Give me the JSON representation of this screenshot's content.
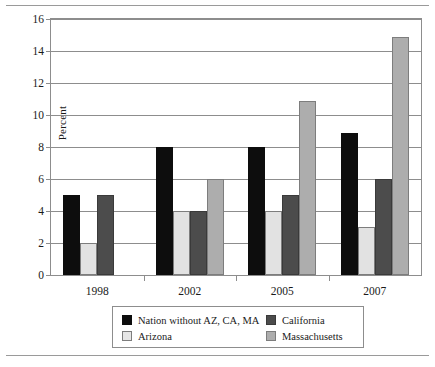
{
  "chart_data": {
    "type": "bar",
    "title": "",
    "xlabel": "",
    "ylabel": "Percent",
    "categories": [
      "1998",
      "2002",
      "2005",
      "2007"
    ],
    "ylim": [
      0,
      16
    ],
    "yticks": [
      0,
      2,
      4,
      6,
      8,
      10,
      12,
      14,
      16
    ],
    "ytick_labels": [
      "0",
      "2",
      "4",
      "6",
      "8",
      "10",
      "12",
      "14",
      "16"
    ],
    "grid": true,
    "legend_position": "bottom",
    "series": [
      {
        "name": "Nation without AZ, CA, MA",
        "color": "#0d0d0d",
        "values": [
          5,
          8,
          8,
          8.9
        ]
      },
      {
        "name": "Arizona",
        "color": "#e2e2e2",
        "values": [
          2,
          4,
          4,
          3
        ]
      },
      {
        "name": "California",
        "color": "#4c4c4c",
        "values": [
          5,
          4,
          5,
          6
        ]
      },
      {
        "name": "Massachusetts",
        "color": "#adadad",
        "values": [
          null,
          6,
          10.9,
          14.9
        ]
      }
    ]
  },
  "legend": {
    "entries": [
      {
        "label": "Nation without AZ, CA, MA",
        "swatch": "s0"
      },
      {
        "label": "California",
        "swatch": "s2"
      },
      {
        "label": "Arizona",
        "swatch": "s1"
      },
      {
        "label": "Massachusetts",
        "swatch": "s3"
      }
    ]
  }
}
